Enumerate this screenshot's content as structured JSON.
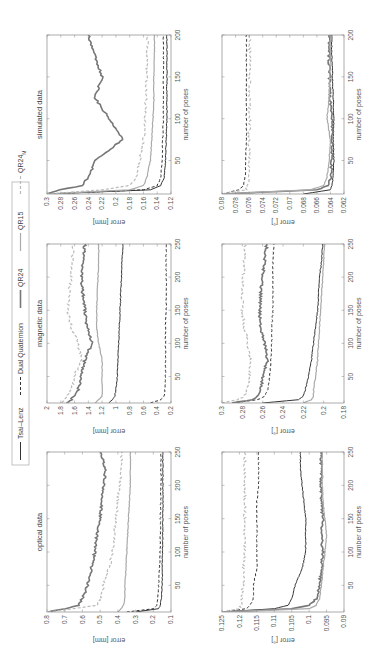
{
  "figure": {
    "orientation": "rotated-90-ccw",
    "legend": [
      {
        "label": "Tsai–Lenz",
        "color": "#333333",
        "dash": "",
        "width": 1.0
      },
      {
        "label": "Dual Quaternion",
        "color": "#333333",
        "dash": "3,2",
        "width": 1.0
      },
      {
        "label": "QR24",
        "color": "#777777",
        "dash": "",
        "width": 1.6
      },
      {
        "label": "QR15",
        "color": "#aaaaaa",
        "dash": "",
        "width": 1.2
      },
      {
        "label": "QR24M",
        "color": "#bbbbbb",
        "dash": "3,2",
        "width": 1.2
      }
    ]
  },
  "chart_data": [
    {
      "type": "line",
      "title": "optical data",
      "xlabel": "number of poses",
      "ylabel": "error [mm]",
      "xlim": [
        10,
        250
      ],
      "ylim": [
        0.1,
        0.8
      ],
      "xticks": [
        50,
        100,
        150,
        200,
        250
      ],
      "yticks": [
        0.1,
        0.2,
        0.3,
        0.4,
        0.5,
        0.6,
        0.7,
        0.8
      ],
      "ytick_labels": [
        "0.1",
        "0.2",
        "0.3",
        "0.4",
        "0.5",
        "0.6",
        "0.7",
        "0.8"
      ],
      "x": [
        10,
        15,
        20,
        30,
        50,
        75,
        100,
        125,
        150,
        175,
        200,
        225,
        250
      ],
      "series": [
        {
          "name": "Tsai–Lenz",
          "values": [
            0.3,
            0.17,
            0.16,
            0.155,
            0.15,
            0.15,
            0.148,
            0.147,
            0.146,
            0.146,
            0.146,
            0.146,
            0.146
          ]
        },
        {
          "name": "Dual Quaternion",
          "values": [
            0.35,
            0.2,
            0.18,
            0.175,
            0.17,
            0.165,
            0.162,
            0.16,
            0.16,
            0.158,
            0.157,
            0.157,
            0.157
          ]
        },
        {
          "name": "QR24",
          "values": [
            0.8,
            0.7,
            0.62,
            0.6,
            0.57,
            0.55,
            0.53,
            0.52,
            0.5,
            0.49,
            0.48,
            0.47,
            0.5
          ]
        },
        {
          "name": "QR15",
          "values": [
            0.4,
            0.38,
            0.37,
            0.36,
            0.36,
            0.355,
            0.35,
            0.345,
            0.34,
            0.335,
            0.33,
            0.33,
            0.33
          ]
        },
        {
          "name": "QR24M",
          "values": [
            0.8,
            0.65,
            0.52,
            0.5,
            0.48,
            0.45,
            0.43,
            0.42,
            0.41,
            0.4,
            0.39,
            0.38,
            0.38
          ]
        }
      ]
    },
    {
      "type": "line",
      "title": "magnetic data",
      "xlabel": "number of poses",
      "ylabel": "error [mm]",
      "xlim": [
        10,
        250
      ],
      "ylim": [
        0.2,
        2.0
      ],
      "xticks": [
        50,
        100,
        150,
        200,
        250
      ],
      "yticks": [
        0.2,
        0.4,
        0.6,
        0.8,
        1.0,
        1.2,
        1.4,
        1.6,
        1.8,
        2.0
      ],
      "ytick_labels": [
        "0.2",
        "0.4",
        "0.6",
        "0.8",
        "1",
        "1.2",
        "1.4",
        "1.6",
        "1.8",
        "2"
      ],
      "x": [
        10,
        15,
        20,
        30,
        50,
        75,
        100,
        125,
        150,
        175,
        200,
        225,
        250
      ],
      "series": [
        {
          "name": "Tsai–Lenz",
          "values": [
            1.1,
            1.05,
            1.02,
            1.0,
            0.98,
            0.97,
            0.96,
            0.95,
            0.94,
            0.93,
            0.92,
            0.91,
            0.9
          ]
        },
        {
          "name": "Dual Quaternion",
          "values": [
            0.5,
            0.35,
            0.3,
            0.29,
            0.28,
            0.28,
            0.28,
            0.28,
            0.27,
            0.27,
            0.27,
            0.27,
            0.27
          ]
        },
        {
          "name": "QR24",
          "values": [
            1.7,
            1.65,
            1.6,
            1.55,
            1.5,
            1.45,
            1.35,
            1.42,
            1.45,
            1.48,
            1.5,
            1.48,
            1.45
          ]
        },
        {
          "name": "QR15",
          "values": [
            1.3,
            1.25,
            1.2,
            1.2,
            1.2,
            1.2,
            1.25,
            1.28,
            1.28,
            1.27,
            1.26,
            1.25,
            1.25
          ]
        },
        {
          "name": "QR24M",
          "values": [
            1.8,
            1.75,
            1.7,
            1.65,
            1.6,
            1.5,
            1.55,
            1.65,
            1.7,
            1.68,
            1.65,
            1.63,
            1.62
          ]
        }
      ]
    },
    {
      "type": "line",
      "title": "simulated data",
      "xlabel": "number of poses",
      "ylabel": "error [mm]",
      "xlim": [
        10,
        200
      ],
      "ylim": [
        0.12,
        0.3
      ],
      "xticks": [
        50,
        100,
        150,
        200
      ],
      "yticks": [
        0.12,
        0.14,
        0.16,
        0.18,
        0.2,
        0.22,
        0.24,
        0.26,
        0.28,
        0.3
      ],
      "ytick_labels": [
        "0.12",
        "0.14",
        "0.16",
        "0.18",
        "0.2",
        "0.22",
        "0.24",
        "0.26",
        "0.28",
        "0.3"
      ],
      "x": [
        10,
        15,
        20,
        30,
        50,
        75,
        100,
        125,
        150,
        175,
        200
      ],
      "series": [
        {
          "name": "Tsai–Lenz",
          "values": [
            0.3,
            0.15,
            0.135,
            0.13,
            0.128,
            0.127,
            0.126,
            0.126,
            0.126,
            0.126,
            0.126
          ]
        },
        {
          "name": "Dual Quaternion",
          "values": [
            0.3,
            0.16,
            0.14,
            0.135,
            0.133,
            0.132,
            0.131,
            0.131,
            0.131,
            0.131,
            0.131
          ]
        },
        {
          "name": "QR24",
          "values": [
            0.3,
            0.28,
            0.25,
            0.24,
            0.23,
            0.19,
            0.21,
            0.23,
            0.22,
            0.23,
            0.24
          ]
        },
        {
          "name": "QR15",
          "values": [
            0.3,
            0.18,
            0.16,
            0.155,
            0.15,
            0.148,
            0.146,
            0.145,
            0.145,
            0.144,
            0.144
          ]
        },
        {
          "name": "QR24M",
          "values": [
            0.3,
            0.22,
            0.18,
            0.17,
            0.165,
            0.16,
            0.158,
            0.156,
            0.155,
            0.154,
            0.154
          ]
        }
      ]
    },
    {
      "type": "line",
      "title": "",
      "xlabel": "number of poses",
      "ylabel": "error [°]",
      "xlim": [
        10,
        250
      ],
      "ylim": [
        0.09,
        0.125
      ],
      "xticks": [
        50,
        100,
        150,
        200,
        250
      ],
      "yticks": [
        0.09,
        0.095,
        0.1,
        0.105,
        0.11,
        0.115,
        0.12,
        0.125
      ],
      "ytick_labels": [
        "0.09",
        "0.095",
        "0.1",
        "0.105",
        "0.11",
        "0.115",
        "0.12",
        "0.125"
      ],
      "x": [
        10,
        15,
        20,
        30,
        50,
        75,
        100,
        125,
        150,
        175,
        200,
        225,
        250
      ],
      "series": [
        {
          "name": "Tsai–Lenz",
          "values": [
            0.125,
            0.11,
            0.106,
            0.105,
            0.104,
            0.102,
            0.101,
            0.101,
            0.101,
            0.1015,
            0.102,
            0.1025,
            0.1025
          ]
        },
        {
          "name": "Dual Quaternion",
          "values": [
            0.125,
            0.118,
            0.117,
            0.116,
            0.116,
            0.115,
            0.115,
            0.115,
            0.115,
            0.115,
            0.1145,
            0.1145,
            0.1145
          ]
        },
        {
          "name": "QR24",
          "values": [
            0.125,
            0.105,
            0.1,
            0.098,
            0.097,
            0.0965,
            0.096,
            0.0965,
            0.096,
            0.0965,
            0.0965,
            0.0965,
            0.0965
          ]
        },
        {
          "name": "QR15",
          "values": [
            0.125,
            0.1,
            0.098,
            0.097,
            0.0965,
            0.096,
            0.0955,
            0.095,
            0.0955,
            0.096,
            0.0962,
            0.0962,
            0.0962
          ]
        },
        {
          "name": "QR24M",
          "values": [
            0.125,
            0.12,
            0.1195,
            0.1192,
            0.119,
            0.1188,
            0.1186,
            0.1185,
            0.1185,
            0.1185,
            0.1185,
            0.1185,
            0.1185
          ]
        }
      ]
    },
    {
      "type": "line",
      "title": "",
      "xlabel": "number of poses",
      "ylabel": "error [°]",
      "xlim": [
        10,
        250
      ],
      "ylim": [
        0.18,
        0.3
      ],
      "xticks": [
        50,
        100,
        150,
        200,
        250
      ],
      "yticks": [
        0.18,
        0.2,
        0.22,
        0.24,
        0.26,
        0.28,
        0.3
      ],
      "ytick_labels": [
        "0.18",
        "0.2",
        "0.22",
        "0.24",
        "0.26",
        "0.28",
        "0.3"
      ],
      "x": [
        10,
        15,
        20,
        30,
        50,
        75,
        100,
        125,
        150,
        175,
        200,
        225,
        250
      ],
      "series": [
        {
          "name": "Tsai–Lenz",
          "values": [
            0.26,
            0.225,
            0.22,
            0.218,
            0.215,
            0.212,
            0.21,
            0.208,
            0.206,
            0.205,
            0.204,
            0.202,
            0.201
          ]
        },
        {
          "name": "Dual Quaternion",
          "values": [
            0.29,
            0.265,
            0.258,
            0.255,
            0.253,
            0.252,
            0.251,
            0.251,
            0.25,
            0.25,
            0.25,
            0.25,
            0.249
          ]
        },
        {
          "name": "QR24",
          "values": [
            0.29,
            0.27,
            0.265,
            0.262,
            0.26,
            0.255,
            0.258,
            0.262,
            0.263,
            0.262,
            0.26,
            0.258,
            0.256
          ]
        },
        {
          "name": "QR15",
          "values": [
            0.22,
            0.212,
            0.21,
            0.21,
            0.208,
            0.206,
            0.205,
            0.204,
            0.203,
            0.202,
            0.201,
            0.2,
            0.199
          ]
        },
        {
          "name": "QR24M",
          "values": [
            0.3,
            0.285,
            0.278,
            0.275,
            0.273,
            0.272,
            0.275,
            0.278,
            0.28,
            0.28,
            0.279,
            0.278,
            0.277
          ]
        }
      ]
    },
    {
      "type": "line",
      "title": "",
      "xlabel": "number of poses",
      "ylabel": "error [°]",
      "xlim": [
        10,
        200
      ],
      "ylim": [
        0.062,
        0.08
      ],
      "xticks": [
        50,
        100,
        150,
        200
      ],
      "yticks": [
        0.062,
        0.064,
        0.066,
        0.068,
        0.07,
        0.072,
        0.074,
        0.076,
        0.078,
        0.08
      ],
      "ytick_labels": [
        "0.062",
        "0.064",
        "0.066",
        "0.068",
        "0.07",
        "0.072",
        "0.074",
        "0.076",
        "0.078",
        "0.08"
      ],
      "x": [
        10,
        15,
        20,
        30,
        50,
        75,
        100,
        125,
        150,
        175,
        200
      ],
      "series": [
        {
          "name": "Tsai–Lenz",
          "values": [
            0.068,
            0.064,
            0.0638,
            0.0636,
            0.0635,
            0.0636,
            0.0635,
            0.0636,
            0.0637,
            0.0638,
            0.0638
          ]
        },
        {
          "name": "Dual Quaternion",
          "values": [
            0.08,
            0.0775,
            0.0768,
            0.0766,
            0.0765,
            0.0764,
            0.0764,
            0.0764,
            0.0764,
            0.0764,
            0.0764
          ]
        },
        {
          "name": "QR24",
          "values": [
            0.08,
            0.066,
            0.0645,
            0.064,
            0.0638,
            0.0637,
            0.0638,
            0.064,
            0.0641,
            0.0642,
            0.0642
          ]
        },
        {
          "name": "QR15",
          "values": [
            0.08,
            0.067,
            0.065,
            0.0645,
            0.0642,
            0.064,
            0.0645,
            0.0642,
            0.0641,
            0.064,
            0.064
          ]
        },
        {
          "name": "QR24M",
          "values": [
            0.08,
            0.0765,
            0.0762,
            0.0761,
            0.076,
            0.076,
            0.0759,
            0.0759,
            0.0759,
            0.0759,
            0.0759
          ]
        }
      ]
    }
  ],
  "layout_panels": [
    {
      "ux": 43,
      "uy": 47,
      "w": 160,
      "h": 124
    },
    {
      "ux": 252,
      "uy": 47,
      "w": 159,
      "h": 124
    },
    {
      "ux": 461,
      "uy": 47,
      "w": 159,
      "h": 124
    },
    {
      "ux": 43,
      "uy": 222,
      "w": 160,
      "h": 122
    },
    {
      "ux": 252,
      "uy": 222,
      "w": 159,
      "h": 122
    },
    {
      "ux": 461,
      "uy": 222,
      "w": 159,
      "h": 122
    }
  ]
}
